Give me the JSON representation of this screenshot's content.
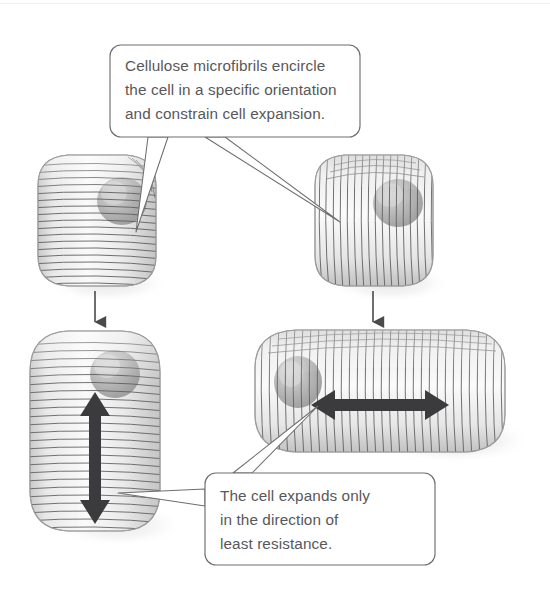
{
  "figure": {
    "background_color": "#ffffff",
    "width": 550,
    "height": 607
  },
  "callouts": [
    {
      "id": "top",
      "name": "callout-top",
      "lines": [
        "Cellulose microfibrils encircle",
        "the cell in a specific orientation",
        "and constrain cell expansion."
      ],
      "text": "Cellulose microfibrils encircle\nthe cell in a specific orientation\nand constrain cell expansion.",
      "text_color": "#58585a",
      "border_color": "#6e6e70",
      "fill_color": "#ffffff",
      "box": {
        "x": 110,
        "y": 45,
        "w": 250,
        "h": 92
      },
      "pointer_targets": [
        "cell-top-left",
        "cell-top-right"
      ]
    },
    {
      "id": "bottom",
      "name": "callout-bottom",
      "lines": [
        "The cell expands only",
        "in the direction of",
        "least resistance."
      ],
      "text": "The cell expands only\nin the direction of\nleast resistance.",
      "text_color": "#58585a",
      "border_color": "#6e6e70",
      "fill_color": "#ffffff",
      "box": {
        "x": 205,
        "y": 473,
        "w": 230,
        "h": 92
      },
      "pointer_targets": [
        "cell-bottom-left",
        "cell-bottom-right"
      ]
    }
  ],
  "cells": [
    {
      "id": "cell-top-left",
      "name": "cell-top-left",
      "label": "Unexpanded cell with transverse (horizontal) microfibrils",
      "shape": "rounded-cube",
      "microfibril_orientation": "horizontal",
      "state": "unexpanded",
      "box": {
        "x": 38,
        "y": 155,
        "w": 118,
        "h": 130
      },
      "nucleus": {
        "cx": 120,
        "cy": 200,
        "r": 22
      }
    },
    {
      "id": "cell-top-right",
      "name": "cell-top-right",
      "label": "Unexpanded cell with longitudinal (vertical) microfibrils",
      "shape": "rounded-cube",
      "microfibril_orientation": "vertical",
      "state": "unexpanded",
      "box": {
        "x": 315,
        "y": 155,
        "w": 118,
        "h": 130
      },
      "nucleus": {
        "cx": 396,
        "cy": 200,
        "r": 22
      }
    },
    {
      "id": "cell-bottom-left",
      "name": "cell-bottom-left",
      "label": "Cell expanded vertically, perpendicular to horizontal microfibrils",
      "shape": "rounded-column",
      "microfibril_orientation": "horizontal",
      "state": "expanded",
      "expansion_direction": "vertical",
      "box": {
        "x": 30,
        "y": 330,
        "w": 130,
        "h": 200
      },
      "nucleus": {
        "cx": 113,
        "cy": 372,
        "r": 22
      }
    },
    {
      "id": "cell-bottom-right",
      "name": "cell-bottom-right",
      "label": "Cell expanded horizontally, perpendicular to vertical microfibrils",
      "shape": "rounded-bar",
      "microfibril_orientation": "vertical",
      "state": "expanded",
      "expansion_direction": "horizontal",
      "box": {
        "x": 255,
        "y": 330,
        "w": 250,
        "h": 122
      },
      "nucleus": {
        "cx": 297,
        "cy": 380,
        "r": 22
      }
    }
  ],
  "arrows": {
    "transition": [
      {
        "id": "arrow-transition-left",
        "name": "arrow-transition-left",
        "direction": "down",
        "from": "cell-top-left",
        "to": "cell-bottom-left",
        "color": "#4a4a4c",
        "x": 95,
        "y1": 291,
        "y2": 325
      },
      {
        "id": "arrow-transition-right",
        "name": "arrow-transition-right",
        "direction": "down",
        "from": "cell-top-right",
        "to": "cell-bottom-right",
        "color": "#4a4a4c",
        "x": 373,
        "y1": 291,
        "y2": 325
      }
    ],
    "expansion": [
      {
        "id": "arrow-expansion-vertical",
        "name": "arrow-expansion-vertical",
        "direction": "vertical-double",
        "in_cell": "cell-bottom-left",
        "color": "#3b3b3d",
        "x": 95,
        "y1": 398,
        "y2": 516
      },
      {
        "id": "arrow-expansion-horizontal",
        "name": "arrow-expansion-horizontal",
        "direction": "horizontal-double",
        "in_cell": "cell-bottom-right",
        "color": "#3b3b3d",
        "y": 405,
        "x1": 317,
        "x2": 443
      }
    ]
  },
  "colors": {
    "cell_fill_light": "#f4f4f4",
    "cell_fill_mid": "#e2e2e2",
    "cell_outline": "#a8a8a8",
    "microfibril": "#5d5d5f",
    "nucleus": "#a9a9a9",
    "shadow": "#d8d8d8",
    "arrow_dark": "#3b3b3d",
    "text": "#58585a"
  }
}
